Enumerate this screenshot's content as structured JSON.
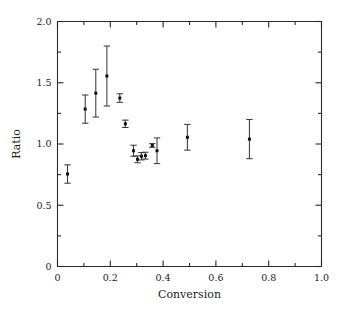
{
  "chart_data": {
    "type": "scatter",
    "title": "",
    "subtitle": "",
    "xlabel": "Conversion",
    "ylabel": "Ratio",
    "xlim": [
      0,
      1.0
    ],
    "ylim": [
      0,
      2.0
    ],
    "grid": false,
    "legend": null,
    "xticks": [
      0,
      0.2,
      0.4,
      0.6,
      0.8,
      1.0
    ],
    "xticklabels": [
      "0",
      "0.2",
      "0.4",
      "0.6",
      "0.8",
      "1.0"
    ],
    "xminorticks": [
      0.1,
      0.3,
      0.5,
      0.7,
      0.9
    ],
    "yticks": [
      0,
      0.5,
      1.0,
      1.5,
      2.0
    ],
    "yticklabels": [
      "0",
      "0.5",
      "1.0",
      "1.5",
      "2.0"
    ],
    "yminorticks": [
      0.25,
      0.75,
      1.25,
      1.75
    ],
    "marker": "square",
    "marker_color": "#111111",
    "errorbar_color": "#3a3a3a",
    "errorbar_direction": "vertical",
    "series": [
      {
        "name": "Ratio vs Conversion",
        "x": [
          0.038,
          0.105,
          0.145,
          0.187,
          0.236,
          0.257,
          0.288,
          0.303,
          0.318,
          0.333,
          0.359,
          0.377,
          0.492,
          0.727
        ],
        "y": [
          0.755,
          1.285,
          1.415,
          1.555,
          1.375,
          1.165,
          0.945,
          0.875,
          0.9,
          0.905,
          0.988,
          0.945,
          1.055,
          1.04
        ],
        "yerr": [
          0.075,
          0.115,
          0.195,
          0.245,
          0.035,
          0.03,
          0.045,
          0.028,
          0.03,
          0.028,
          0.015,
          0.105,
          0.105,
          0.16
        ]
      }
    ],
    "points": [
      {
        "conversion": 0.038,
        "ratio": 0.755,
        "err": 0.075
      },
      {
        "conversion": 0.105,
        "ratio": 1.285,
        "err": 0.115
      },
      {
        "conversion": 0.145,
        "ratio": 1.415,
        "err": 0.195
      },
      {
        "conversion": 0.187,
        "ratio": 1.555,
        "err": 0.245
      },
      {
        "conversion": 0.236,
        "ratio": 1.375,
        "err": 0.035
      },
      {
        "conversion": 0.257,
        "ratio": 1.165,
        "err": 0.03
      },
      {
        "conversion": 0.288,
        "ratio": 0.945,
        "err": 0.045
      },
      {
        "conversion": 0.303,
        "ratio": 0.875,
        "err": 0.028
      },
      {
        "conversion": 0.318,
        "ratio": 0.9,
        "err": 0.03
      },
      {
        "conversion": 0.333,
        "ratio": 0.905,
        "err": 0.028
      },
      {
        "conversion": 0.359,
        "ratio": 0.988,
        "err": 0.015
      },
      {
        "conversion": 0.377,
        "ratio": 0.945,
        "err": 0.105
      },
      {
        "conversion": 0.492,
        "ratio": 1.055,
        "err": 0.105
      },
      {
        "conversion": 0.727,
        "ratio": 1.04,
        "err": 0.16
      }
    ]
  }
}
